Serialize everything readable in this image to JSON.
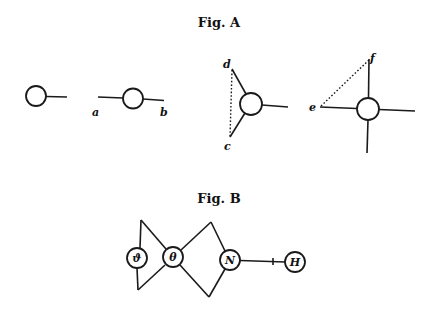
{
  "figure_a": {
    "title": "Fig. A",
    "diagrams": [
      {
        "name": "single-bond",
        "labels": []
      },
      {
        "name": "two-bond",
        "labels": [
          "a",
          "b"
        ]
      },
      {
        "name": "three-bond",
        "labels": [
          "d",
          "c"
        ]
      },
      {
        "name": "four-bond",
        "labels": [
          "e",
          "f"
        ]
      }
    ]
  },
  "figure_b": {
    "title": "Fig. B",
    "nodes": [
      "ϑ",
      "θ",
      "N",
      "H"
    ]
  }
}
